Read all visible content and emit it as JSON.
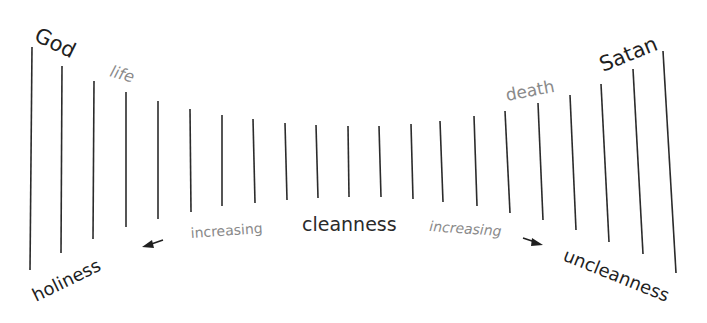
{
  "diagram": {
    "colors": {
      "line": "#2b2b2b",
      "dark_text": "#1f1f1f",
      "gray_text": "#8a8a8a",
      "background": "#ffffff"
    },
    "lines": [
      {
        "x1": 32,
        "y1": 47,
        "x2": 30,
        "y2": 270
      },
      {
        "x1": 62,
        "y1": 66,
        "x2": 61,
        "y2": 253
      },
      {
        "x1": 94,
        "y1": 81,
        "x2": 93,
        "y2": 239
      },
      {
        "x1": 126,
        "y1": 92,
        "x2": 126,
        "y2": 227
      },
      {
        "x1": 158,
        "y1": 101,
        "x2": 158,
        "y2": 219
      },
      {
        "x1": 190,
        "y1": 109,
        "x2": 191,
        "y2": 212
      },
      {
        "x1": 222,
        "y1": 115,
        "x2": 222,
        "y2": 206
      },
      {
        "x1": 253,
        "y1": 119,
        "x2": 255,
        "y2": 203
      },
      {
        "x1": 285,
        "y1": 123,
        "x2": 287,
        "y2": 200
      },
      {
        "x1": 316,
        "y1": 125,
        "x2": 318,
        "y2": 198
      },
      {
        "x1": 348,
        "y1": 126,
        "x2": 349,
        "y2": 197
      },
      {
        "x1": 379,
        "y1": 126,
        "x2": 381,
        "y2": 197
      },
      {
        "x1": 411,
        "y1": 124,
        "x2": 413,
        "y2": 199
      },
      {
        "x1": 440,
        "y1": 121,
        "x2": 443,
        "y2": 202
      },
      {
        "x1": 474,
        "y1": 116,
        "x2": 477,
        "y2": 206
      },
      {
        "x1": 505,
        "y1": 111,
        "x2": 510,
        "y2": 213
      },
      {
        "x1": 538,
        "y1": 103,
        "x2": 543,
        "y2": 220
      },
      {
        "x1": 570,
        "y1": 95,
        "x2": 576,
        "y2": 230
      },
      {
        "x1": 601,
        "y1": 84,
        "x2": 609,
        "y2": 242
      },
      {
        "x1": 633,
        "y1": 69,
        "x2": 643,
        "y2": 254
      },
      {
        "x1": 663,
        "y1": 51,
        "x2": 676,
        "y2": 273
      }
    ],
    "labels": {
      "god": "God",
      "life": "life",
      "holiness": "holiness",
      "increasing_left": "increasing",
      "cleanness": "cleanness",
      "increasing_right": "increasing",
      "death": "death",
      "satan": "Satan",
      "uncleanness": "uncleanness"
    },
    "arrows": {
      "left": {
        "direction": "left-down",
        "from": [
          163,
          240
        ],
        "to": [
          142,
          247
        ]
      },
      "right": {
        "direction": "right-down",
        "from": [
          523,
          238
        ],
        "to": [
          543,
          245
        ]
      }
    }
  }
}
